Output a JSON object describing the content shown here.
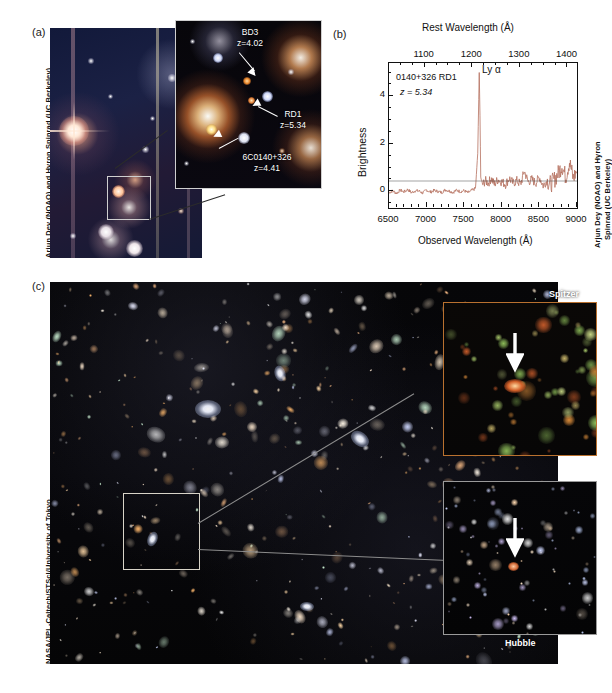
{
  "figure": {
    "panels": [
      {
        "id": "a",
        "label": "(a)"
      },
      {
        "id": "b",
        "label": "(b)"
      },
      {
        "id": "c",
        "label": "(c)"
      }
    ]
  },
  "panel_a": {
    "label": "(a)",
    "credit": "Arjun Dey (NOAO) and Hyron Spinrad (UC Berkeley)",
    "annotations": [
      {
        "name": "BD3",
        "redshift": "z=4.02"
      },
      {
        "name": "RD1",
        "redshift": "z=5.34"
      },
      {
        "name": "6C0140+326",
        "redshift": "z=4.41"
      }
    ]
  },
  "panel_b": {
    "label": "(b)",
    "credit_line1": "Arjun Dey (NOAO) and Hyron",
    "credit_line2": "Spinrad (UC Berkeley)",
    "object_label": "0140+326 RD1",
    "redshift_label": "z = 5.34",
    "line_label": "Ly α"
  },
  "panel_c": {
    "label": "(c)",
    "credit": "NASA/JPL-Caltech/STScI/University of Tokyo",
    "inset_top_label": "Spitzer",
    "inset_bottom_label": "Hubble"
  },
  "chart_data": {
    "type": "line",
    "title": "",
    "xlabel": "Observed Wavelength (Å)",
    "ylabel": "Brightness",
    "x2label": "Rest Wavelength (Å)",
    "xlim": [
      6500,
      9000
    ],
    "ylim": [
      -0.7,
      5.4
    ],
    "x2lim": [
      1025,
      1420
    ],
    "xticks": [
      6500,
      7000,
      7500,
      8000,
      8500,
      9000
    ],
    "xticklabels": [
      "6500",
      "7000",
      "7500",
      "8000",
      "8500",
      "9000"
    ],
    "yticks": [
      0,
      2,
      4
    ],
    "yticklabels": [
      "0",
      "2",
      "4"
    ],
    "x2ticks": [
      1100,
      1200,
      1300,
      1400
    ],
    "x2ticklabels": [
      "1100",
      "1200",
      "1300",
      "1400"
    ],
    "grid": false,
    "legend": false,
    "annotations": [
      {
        "text": "0140+326 RD1",
        "x": 6620,
        "y": 4.85
      },
      {
        "text": "z = 5.34",
        "x": 6650,
        "y": 4.15
      },
      {
        "text": "Ly α",
        "x": 7690,
        "y": 5.15
      }
    ],
    "series": [
      {
        "name": "0140+326 RD1 spectrum",
        "color": "#b5705e",
        "comment": "Flux vs observed wavelength; strong Ly-alpha emission peak at ~7700 Angstrom reaching ~5 units, flat noisy continuum near zero blueward, rising noisy sky-residual structure redward of 8600 Angstrom.",
        "x": [
          6500,
          6550,
          6600,
          6650,
          6700,
          6750,
          6800,
          6850,
          6900,
          6950,
          7000,
          7050,
          7100,
          7150,
          7200,
          7250,
          7300,
          7350,
          7400,
          7450,
          7500,
          7550,
          7600,
          7650,
          7680,
          7700,
          7710,
          7720,
          7740,
          7780,
          7820,
          7860,
          7900,
          7950,
          8000,
          8050,
          8100,
          8150,
          8200,
          8250,
          8300,
          8350,
          8400,
          8450,
          8500,
          8550,
          8600,
          8650,
          8700,
          8750,
          8800,
          8850,
          8900,
          8950,
          9000
        ],
        "y": [
          -0.05,
          0.02,
          -0.08,
          0.05,
          -0.02,
          0.08,
          -0.06,
          0.03,
          0.01,
          -0.07,
          0.06,
          -0.03,
          0.04,
          0.0,
          -0.05,
          0.07,
          0.02,
          -0.04,
          0.05,
          -0.01,
          0.03,
          -0.06,
          0.04,
          0.12,
          1.6,
          5.0,
          3.2,
          0.6,
          0.25,
          0.45,
          0.35,
          0.55,
          0.3,
          0.5,
          0.4,
          0.3,
          0.55,
          0.35,
          0.45,
          0.3,
          0.85,
          0.4,
          0.5,
          0.35,
          0.6,
          0.25,
          0.45,
          0.3,
          0.5,
          0.75,
          1.1,
          0.6,
          1.25,
          0.55,
          0.9
        ]
      }
    ]
  }
}
